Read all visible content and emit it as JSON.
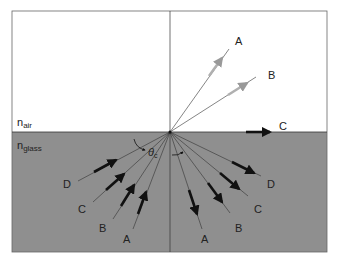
{
  "diagram": {
    "colors": {
      "air": "#ffffff",
      "glass": "#8f8f8f",
      "border": "#555555",
      "ray": "#333333",
      "arrow_dark": "#111111",
      "arrow_light": "#b0b0b0"
    },
    "media": {
      "air_label": "n",
      "air_sub": "air",
      "glass_label": "n",
      "glass_sub": "glass"
    },
    "angle_label": "θ",
    "angle_sub": "c",
    "refracted_rays": [
      {
        "label": "A"
      },
      {
        "label": "B"
      },
      {
        "label": "C"
      }
    ],
    "incident_rays": [
      {
        "label": "D"
      },
      {
        "label": "C"
      },
      {
        "label": "B"
      },
      {
        "label": "A"
      }
    ],
    "reflected_rays": [
      {
        "label": "A"
      },
      {
        "label": "B"
      },
      {
        "label": "C"
      },
      {
        "label": "D"
      }
    ]
  }
}
